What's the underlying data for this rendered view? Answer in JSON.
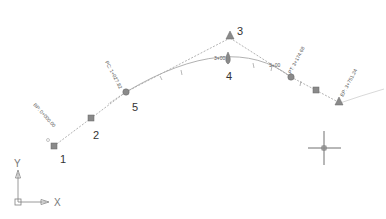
{
  "drawing": {
    "colors": {
      "line": "#9a9a9a",
      "marker": "#808080",
      "text": "#333333",
      "crosshair": "#606060"
    },
    "points": [
      {
        "id": "1",
        "label": "1",
        "x": 54,
        "y": 146,
        "shape": "square"
      },
      {
        "id": "2",
        "label": "2",
        "x": 91,
        "y": 118,
        "shape": "square"
      },
      {
        "id": "5",
        "label": "5",
        "x": 126,
        "y": 92,
        "shape": "circle"
      },
      {
        "id": "3",
        "label": "3",
        "x": 230,
        "y": 36,
        "shape": "triangle"
      },
      {
        "id": "4",
        "label": "4",
        "x": 230,
        "y": 63,
        "shape": "teardrop"
      },
      {
        "id": "pt",
        "label": "",
        "x": 291,
        "y": 77,
        "shape": "circle"
      },
      {
        "id": "sq6",
        "label": "",
        "x": 316,
        "y": 90,
        "shape": "square"
      },
      {
        "id": "ep",
        "label": "",
        "x": 338,
        "y": 101,
        "shape": "triangle"
      }
    ],
    "station_labels": [
      {
        "text": "BP: 0+000.00",
        "x": 36,
        "y": 102,
        "angle": 48
      },
      {
        "text": "PC: 1+027.82",
        "x": 108,
        "y": 59,
        "angle": 62
      },
      {
        "text": "PT: 3+174.68",
        "x": 303,
        "y": 45,
        "angle": -62
      },
      {
        "text": "EP: 3+751.24",
        "x": 356,
        "y": 68,
        "angle": -62
      }
    ],
    "curve_labels": [
      {
        "text": "3+00",
        "x": 216,
        "y": 58
      },
      {
        "text": "3+00",
        "x": 270,
        "y": 65
      }
    ],
    "point_numbers": [
      {
        "text": "1",
        "x": 60,
        "y": 162
      },
      {
        "text": "2",
        "x": 93,
        "y": 138
      },
      {
        "text": "5",
        "x": 132,
        "y": 110
      },
      {
        "text": "3",
        "x": 237,
        "y": 34
      },
      {
        "text": "4",
        "x": 227,
        "y": 79
      }
    ],
    "ucs": {
      "x_label": "X",
      "y_label": "Y"
    },
    "crosshair": {
      "x": 324,
      "y": 148
    }
  }
}
